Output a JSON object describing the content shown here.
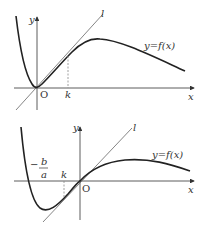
{
  "graph1": {
    "y_axis": "y",
    "x_axis": "x",
    "origin": "O",
    "tangent": "l",
    "curve": "y=f(x)",
    "point": "k"
  },
  "graph2": {
    "y_axis": "y",
    "x_axis": "x",
    "origin": "O",
    "tangent": "l",
    "curve": "y=f(x)",
    "point": "k",
    "root_num": "b",
    "root_den": "a",
    "root_sign": "−"
  }
}
